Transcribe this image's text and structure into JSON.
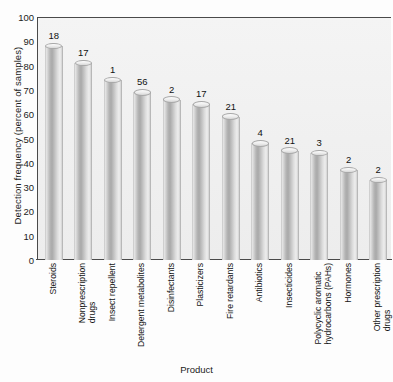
{
  "chart_data": {
    "type": "bar",
    "title": "",
    "xlabel": "Product",
    "ylabel": "Detection frequency (percent of samples)",
    "ylim": [
      0,
      100
    ],
    "ytick_labels": [
      "100",
      "90",
      "80",
      "70",
      "60",
      "50",
      "40",
      "30",
      "20",
      "10",
      "0"
    ],
    "ytick_values": [
      100,
      90,
      80,
      70,
      60,
      50,
      40,
      30,
      20,
      10,
      0
    ],
    "grid": false,
    "legend": "none",
    "orientation": "vertical",
    "bar_style": "3d-cylinder",
    "categories": [
      "Steroids",
      "Nonprescription drugs",
      "Insect repellent",
      "Detergent metabolites",
      "Disinfectants",
      "Plasticizers",
      "Fire retardants",
      "Antibiotics",
      "Insecticides",
      "Polycyclic aromatic hydrocarbons (PAHs)",
      "Hormones",
      "Other prescription drugs"
    ],
    "category_lines": [
      [
        "Steroids"
      ],
      [
        "Nonprescription",
        "drugs"
      ],
      [
        "Insect repellent"
      ],
      [
        "Detergent metabolites"
      ],
      [
        "Disinfectants"
      ],
      [
        "Plasticizers"
      ],
      [
        "Fire retardants"
      ],
      [
        "Antibiotics"
      ],
      [
        "Insecticides"
      ],
      [
        "Polycyclic aromatic",
        "hydrocarbons (PAHs)"
      ],
      [
        "Hormones"
      ],
      [
        "Other prescription",
        "drugs"
      ]
    ],
    "values": [
      88,
      81,
      74,
      69,
      66,
      64,
      59,
      48,
      45,
      44,
      37,
      33
    ],
    "bar_labels": [
      "18",
      "17",
      "1",
      "56",
      "2",
      "17",
      "21",
      "4",
      "21",
      "3",
      "2",
      "2"
    ],
    "bar_label_meaning": "number of compounds"
  },
  "axis": {
    "x_title": "Product",
    "y_title": "Detection frequency (percent of samples)"
  },
  "colors": {
    "plot_background": "#f1f1f1",
    "axis_line": "#4a4a4a",
    "bar_light": "#ececec",
    "bar_dark": "#a9a9a9",
    "text": "#141414",
    "page_background": "#ffffff"
  }
}
